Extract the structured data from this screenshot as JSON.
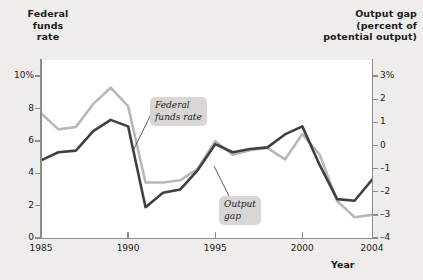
{
  "titles": {
    "left_axis": "Federal\nfunds\nrate",
    "left_axis_line1": "Federal",
    "left_axis_line2": "funds",
    "left_axis_line3": "rate",
    "right_axis_line1": "Output gap",
    "right_axis_line2": "(percent of",
    "right_axis_line3": "potential output)",
    "x_axis": "Year"
  },
  "callouts": {
    "federal_funds_rate_line1": "Federal",
    "federal_funds_rate_line2": "funds rate",
    "output_gap_line1": "Output",
    "output_gap_line2": "gap"
  },
  "colors": {
    "federal_funds_rate": "#404040",
    "output_gap": "#b8b8b8",
    "axis": "#8c8c8c",
    "plot_background": "#ffffff",
    "page_background": "#eeedeb",
    "callout_background": "#d8d7d5",
    "text": "#1a1a1a"
  },
  "chart_data": {
    "type": "line",
    "title": "",
    "xlabel": "Year",
    "grid": false,
    "legend": "inline-callouts",
    "x": [
      1985,
      1986,
      1987,
      1988,
      1989,
      1990,
      1991,
      1992,
      1993,
      1994,
      1995,
      1996,
      1997,
      1998,
      1999,
      2000,
      2001,
      2002,
      2003,
      2004
    ],
    "xlim": [
      1985,
      2004
    ],
    "xticks": [
      1985,
      1990,
      1995,
      2000,
      2004
    ],
    "xtick_labels": [
      "1985",
      "1990",
      "1995",
      "2000",
      "2004"
    ],
    "axes": [
      {
        "name": "left",
        "label": "Federal funds rate",
        "ylim": [
          0,
          11
        ],
        "yticks": [
          0,
          2,
          4,
          6,
          8,
          10
        ],
        "ytick_labels": [
          "0",
          "2",
          "4",
          "6",
          "8",
          "10%"
        ]
      },
      {
        "name": "right",
        "label": "Output gap (percent of potential output)",
        "ylim": [
          -4,
          3.7
        ],
        "yticks": [
          -4,
          -3,
          -2,
          -1,
          0,
          1,
          2,
          3
        ],
        "ytick_labels": [
          "-4",
          "-3",
          "-2",
          "-1",
          "0",
          "1",
          "2",
          "3%"
        ]
      }
    ],
    "series": [
      {
        "name": "Federal funds rate",
        "axis": "left",
        "units": "percent",
        "color": "#404040",
        "values": [
          4.8,
          5.3,
          5.4,
          6.6,
          7.3,
          6.9,
          1.9,
          2.8,
          3.0,
          4.2,
          5.8,
          5.3,
          5.5,
          5.6,
          6.4,
          6.9,
          4.5,
          2.4,
          2.3,
          3.6
        ]
      },
      {
        "name": "Output gap",
        "axis": "right",
        "units": "percent of potential output",
        "color": "#b8b8b8",
        "values": [
          1.4,
          0.7,
          0.8,
          1.8,
          2.5,
          1.7,
          -1.6,
          -1.6,
          -1.5,
          -1.0,
          0.2,
          -0.4,
          -0.2,
          -0.1,
          -0.6,
          0.5,
          -0.4,
          -2.4,
          -3.1,
          -3.0
        ]
      }
    ]
  }
}
